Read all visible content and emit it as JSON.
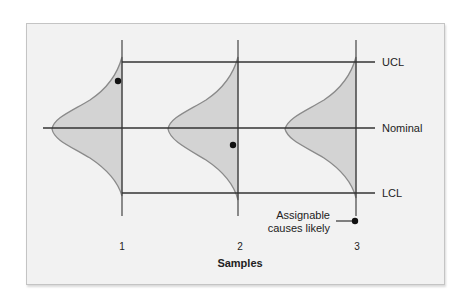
{
  "diagram": {
    "type": "control-chart-sampling-distributions",
    "x_axis_title": "Samples",
    "samples": [
      {
        "label": "1",
        "x": 122
      },
      {
        "label": "2",
        "x": 238
      },
      {
        "label": "3",
        "x": 356
      }
    ],
    "limits": {
      "ucl": {
        "label": "UCL",
        "y": 62
      },
      "nominal": {
        "label": "Nominal",
        "y": 128
      },
      "lcl": {
        "label": "LCL",
        "y": 193
      }
    },
    "annotation": {
      "line1": "Assignable",
      "line2": "causes likely"
    },
    "colors": {
      "frame_bg": "#f2f2f2",
      "curve_fill": "#d3d3d3",
      "curve_stroke": "#8a8a8a",
      "line": "#333333"
    }
  }
}
